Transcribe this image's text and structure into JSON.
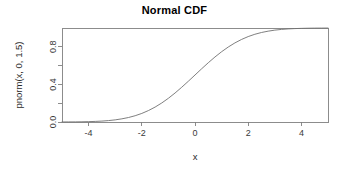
{
  "chart_data": {
    "type": "line",
    "title": "Normal CDF",
    "xlabel": "x",
    "ylabel": "pnorm(x, 0, 1.5)",
    "xlim": [
      -5,
      5
    ],
    "ylim": [
      0,
      1
    ],
    "grid": false,
    "legend": null,
    "x_ticks": [
      -4,
      -2,
      0,
      2,
      4
    ],
    "x_tick_labels": [
      "-4",
      "-2",
      "0",
      "2",
      "4"
    ],
    "y_ticks": [
      0.0,
      0.2,
      0.4,
      0.6,
      0.8
    ],
    "y_tick_labels": [
      "0.0",
      "",
      "0.4",
      "",
      "0.8"
    ],
    "y_labeled_ticks": [
      {
        "value": 0.0,
        "label": "0.0"
      },
      {
        "value": 0.4,
        "label": "0.4"
      },
      {
        "value": 0.8,
        "label": "0.8"
      }
    ],
    "distribution": {
      "mean": 0,
      "sd": 1.5
    },
    "series": [
      {
        "name": "pnorm(x, 0, 1.5)",
        "color": "#707070",
        "x": [
          -5.0,
          -4.75,
          -4.5,
          -4.25,
          -4.0,
          -3.75,
          -3.5,
          -3.25,
          -3.0,
          -2.75,
          -2.5,
          -2.25,
          -2.0,
          -1.75,
          -1.5,
          -1.25,
          -1.0,
          -0.75,
          -0.5,
          -0.25,
          0.0,
          0.25,
          0.5,
          0.75,
          1.0,
          1.25,
          1.5,
          1.75,
          2.0,
          2.25,
          2.5,
          2.75,
          3.0,
          3.25,
          3.5,
          3.75,
          4.0,
          4.25,
          4.5,
          4.75,
          5.0
        ],
        "values": [
          0.0004,
          0.0008,
          0.0013,
          0.0022,
          0.0038,
          0.0062,
          0.0098,
          0.0151,
          0.0228,
          0.0336,
          0.0478,
          0.0668,
          0.0912,
          0.1217,
          0.1587,
          0.2023,
          0.2525,
          0.3085,
          0.3694,
          0.4338,
          0.5,
          0.5662,
          0.6306,
          0.6915,
          0.7475,
          0.7977,
          0.8413,
          0.8783,
          0.9088,
          0.9332,
          0.9522,
          0.9664,
          0.9772,
          0.9849,
          0.9902,
          0.9938,
          0.9962,
          0.9978,
          0.9987,
          0.9992,
          0.9996
        ]
      }
    ]
  },
  "plot_box": {
    "left": 62,
    "right": 328,
    "top": 28,
    "bottom": 122
  }
}
